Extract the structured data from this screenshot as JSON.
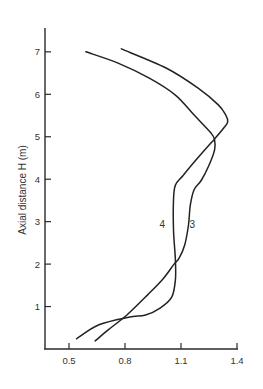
{
  "chart_data": {
    "type": "line",
    "title": "",
    "xlabel": "",
    "ylabel": "Axial distance H (m)",
    "xlim": [
      0.38,
      1.4
    ],
    "ylim": [
      0,
      7.5
    ],
    "xticks": [
      0.5,
      0.8,
      1.1,
      1.4
    ],
    "xtick_labels": [
      "0.5",
      "0.8",
      "1.1",
      "1.4"
    ],
    "yticks": [
      1,
      2,
      3,
      4,
      5,
      6,
      7
    ],
    "ytick_labels": [
      "1",
      "2",
      "3",
      "4",
      "5",
      "6",
      "7"
    ],
    "grid": false,
    "legend": "none (series labelled inline)",
    "orientation": "value on x-axis, axial distance on y-axis",
    "series": [
      {
        "name": "3",
        "label_position": {
          "x": 1.16,
          "y": 2.95
        },
        "points": [
          {
            "x": 0.59,
            "y": 7.0
          },
          {
            "x": 0.76,
            "y": 6.74
          },
          {
            "x": 0.93,
            "y": 6.38
          },
          {
            "x": 1.07,
            "y": 5.98
          },
          {
            "x": 1.17,
            "y": 5.51
          },
          {
            "x": 1.26,
            "y": 5.09
          },
          {
            "x": 1.28,
            "y": 4.92
          },
          {
            "x": 1.28,
            "y": 4.69
          },
          {
            "x": 1.25,
            "y": 4.33
          },
          {
            "x": 1.21,
            "y": 3.98
          },
          {
            "x": 1.17,
            "y": 3.75
          },
          {
            "x": 1.15,
            "y": 3.39
          },
          {
            "x": 1.14,
            "y": 2.92
          },
          {
            "x": 1.12,
            "y": 2.45
          },
          {
            "x": 1.09,
            "y": 2.14
          },
          {
            "x": 1.06,
            "y": 1.98
          },
          {
            "x": 1.0,
            "y": 1.63
          },
          {
            "x": 0.92,
            "y": 1.27
          },
          {
            "x": 0.81,
            "y": 0.8
          },
          {
            "x": 0.71,
            "y": 0.45
          },
          {
            "x": 0.64,
            "y": 0.19
          }
        ]
      },
      {
        "name": "4",
        "label_position": {
          "x": 1.0,
          "y": 2.95
        },
        "points": [
          {
            "x": 0.78,
            "y": 7.07
          },
          {
            "x": 1.02,
            "y": 6.62
          },
          {
            "x": 1.19,
            "y": 6.15
          },
          {
            "x": 1.3,
            "y": 5.75
          },
          {
            "x": 1.34,
            "y": 5.51
          },
          {
            "x": 1.35,
            "y": 5.35
          },
          {
            "x": 1.33,
            "y": 5.21
          },
          {
            "x": 1.28,
            "y": 4.95
          },
          {
            "x": 1.18,
            "y": 4.45
          },
          {
            "x": 1.11,
            "y": 4.08
          },
          {
            "x": 1.07,
            "y": 3.86
          },
          {
            "x": 1.06,
            "y": 3.51
          },
          {
            "x": 1.06,
            "y": 2.8
          },
          {
            "x": 1.07,
            "y": 2.1
          },
          {
            "x": 1.07,
            "y": 1.63
          },
          {
            "x": 1.05,
            "y": 1.22
          },
          {
            "x": 0.99,
            "y": 0.97
          },
          {
            "x": 0.91,
            "y": 0.8
          },
          {
            "x": 0.82,
            "y": 0.75
          },
          {
            "x": 0.66,
            "y": 0.57
          },
          {
            "x": 0.54,
            "y": 0.24
          }
        ]
      }
    ]
  }
}
